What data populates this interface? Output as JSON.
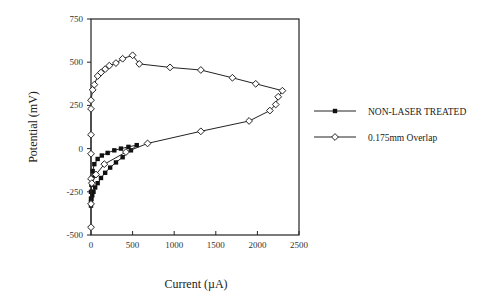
{
  "chart_data": {
    "type": "line",
    "title": "",
    "xlabel": "Current (µA)",
    "ylabel": "Potential (mV)",
    "xlim": [
      0,
      2500
    ],
    "ylim": [
      -500,
      750
    ],
    "xticks": [
      0,
      500,
      1000,
      1500,
      2000,
      2500
    ],
    "yticks": [
      750,
      500,
      250,
      0,
      -250,
      -500
    ],
    "grid": false,
    "legend_position": "right",
    "series": [
      {
        "name": "NON-LASER TREATED",
        "marker": "filled-square",
        "x": [
          0,
          0,
          0,
          5,
          10,
          20,
          40,
          80,
          130,
          200,
          280,
          360,
          450,
          550,
          480,
          380,
          300,
          230,
          170,
          120,
          80,
          50,
          30,
          15,
          5,
          0
        ],
        "y": [
          -330,
          -290,
          -250,
          -210,
          -170,
          -130,
          -90,
          -60,
          -40,
          -25,
          -10,
          0,
          10,
          20,
          -10,
          -50,
          -80,
          -110,
          -140,
          -170,
          -200,
          -225,
          -250,
          -270,
          -290,
          -310
        ]
      },
      {
        "name": "0.175mm Overlap",
        "marker": "open-diamond",
        "x": [
          0,
          0,
          0,
          0,
          0,
          0,
          0,
          20,
          40,
          80,
          120,
          170,
          220,
          300,
          380,
          500,
          580,
          950,
          1320,
          1700,
          1980,
          2300,
          2250,
          2220,
          2150,
          1900,
          1320,
          680,
          420,
          160,
          60,
          10
        ],
        "y": [
          -455,
          -320,
          -175,
          -30,
          80,
          230,
          280,
          340,
          370,
          420,
          440,
          460,
          480,
          495,
          520,
          540,
          490,
          470,
          455,
          410,
          375,
          335,
          300,
          255,
          220,
          160,
          100,
          30,
          -20,
          -90,
          -150,
          -200
        ]
      }
    ]
  },
  "axes": {
    "x_title": "Current (µA)",
    "y_title": "Potential (mV)",
    "x_tick_labels": [
      "0",
      "500",
      "1000",
      "1500",
      "2000",
      "2500"
    ],
    "y_tick_labels": [
      "750",
      "500",
      "250",
      "0",
      "-250",
      "-500"
    ]
  },
  "legend": {
    "items": [
      {
        "label": "NON-LASER TREATED",
        "marker": "filled-square"
      },
      {
        "label": "0.175mm Overlap",
        "marker": "open-diamond"
      }
    ]
  },
  "colors": {
    "line": "#222222",
    "marker_fill_open": "#ffffff",
    "marker_fill_filled": "#111111",
    "frame": "#222222"
  }
}
